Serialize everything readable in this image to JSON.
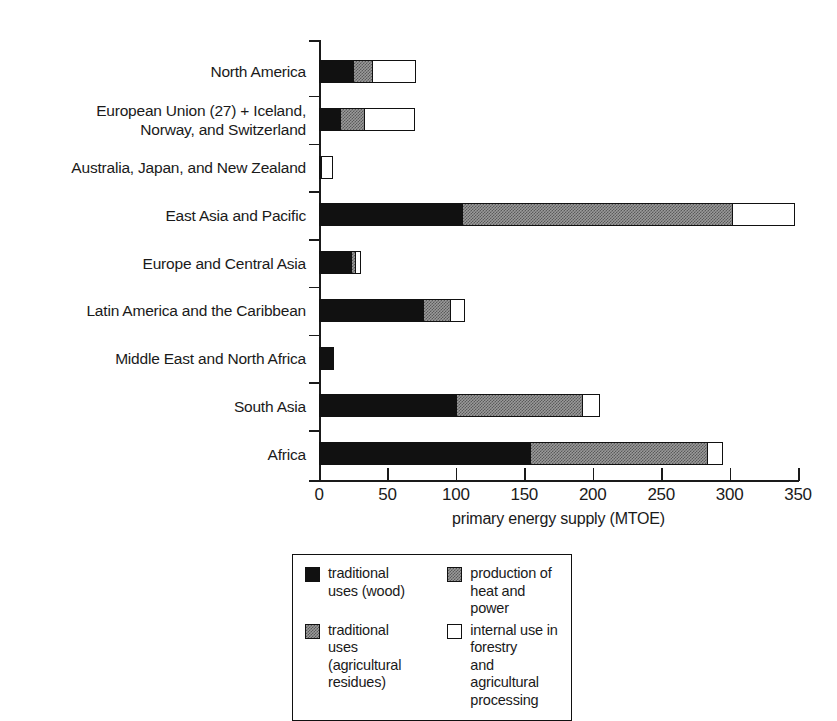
{
  "chart_data": {
    "type": "bar",
    "orientation": "horizontal",
    "stacked": true,
    "title": "",
    "xlabel": "primary energy supply (MTOE)",
    "ylabel": "",
    "xlim": [
      0,
      350
    ],
    "xticks": [
      0,
      50,
      100,
      150,
      200,
      250,
      300,
      350
    ],
    "xticklabels": [
      "0",
      "50",
      "100",
      "150",
      "200",
      "250",
      "300",
      "350"
    ],
    "grid": false,
    "legend_position": "bottom",
    "categories": [
      "North America",
      "European Union (27) + Iceland,\nNorway, and Switzerland",
      "Australia, Japan, and New Zealand",
      "East Asia and Pacific",
      "Europe and Central Asia",
      "Latin America and the Caribbean",
      "Middle East and North Africa",
      "South Asia",
      "Africa"
    ],
    "series": [
      {
        "name": "traditional uses (wood)",
        "swatch": "black",
        "color": "#111111",
        "values": [
          25,
          15,
          1,
          104,
          24,
          76,
          11,
          100,
          154
        ]
      },
      {
        "name": "traditional uses\n(agricultural residues)",
        "swatch": "gray",
        "color": "#9a9a9a",
        "values": [
          0,
          0,
          0,
          0,
          3,
          0,
          0,
          0,
          0
        ]
      },
      {
        "name": "production of heat and power",
        "swatch": "gray",
        "color": "#9a9a9a",
        "values": [
          14,
          18,
          0,
          198,
          0,
          20,
          0,
          93,
          130
        ]
      },
      {
        "name": "internal use in forestry\nand agricultural processing",
        "swatch": "white",
        "color": "#ffffff",
        "values": [
          32,
          37,
          9,
          46,
          4,
          11,
          0,
          12,
          11
        ]
      }
    ],
    "totals": [
      71,
      70,
      10,
      348,
      31,
      107,
      11,
      205,
      295
    ]
  },
  "legend": {
    "entries": [
      {
        "label": "traditional uses (wood)",
        "swatch": "black"
      },
      {
        "label": "production of heat and power",
        "swatch": "gray"
      },
      {
        "label": "traditional uses\n(agricultural residues)",
        "swatch": "gray"
      },
      {
        "label": "internal use in forestry\nand agricultural processing",
        "swatch": "white"
      }
    ]
  }
}
